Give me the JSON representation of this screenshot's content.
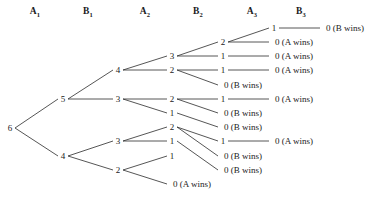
{
  "headers": [
    {
      "label": "A",
      "sub": "1",
      "x": 35
    },
    {
      "label": "B",
      "sub": "1",
      "x": 88
    },
    {
      "label": "A",
      "sub": "2",
      "x": 145
    },
    {
      "label": "B",
      "sub": "2",
      "x": 198
    },
    {
      "label": "A",
      "sub": "3",
      "x": 252
    },
    {
      "label": "B",
      "sub": "3",
      "x": 301
    }
  ],
  "labels": {
    "a_wins": "(A wins)",
    "b_wins": "(B wins)"
  },
  "chart_data": {
    "type": "tree",
    "root_value": "6",
    "leaf_count": 10,
    "columns": [
      "A1",
      "B1",
      "A2",
      "B2",
      "A3",
      "B3"
    ],
    "nodes": [
      {
        "id": "root",
        "value": "6",
        "col": 0,
        "x": 10,
        "y": 128
      },
      {
        "id": "n5",
        "value": "5",
        "col": 1,
        "x": 63,
        "y": 99
      },
      {
        "id": "n4b",
        "value": "4",
        "col": 1,
        "x": 63,
        "y": 156
      },
      {
        "id": "n5_4",
        "value": "4",
        "col": 2,
        "x": 118,
        "y": 70
      },
      {
        "id": "n5_3",
        "value": "3",
        "col": 2,
        "x": 118,
        "y": 99
      },
      {
        "id": "n4_3",
        "value": "3",
        "col": 2,
        "x": 118,
        "y": 141
      },
      {
        "id": "n4_2",
        "value": "2",
        "col": 2,
        "x": 118,
        "y": 170
      },
      {
        "id": "a_3",
        "value": "3",
        "col": 3,
        "x": 172,
        "y": 56
      },
      {
        "id": "a_2",
        "value": "2",
        "col": 3,
        "x": 172,
        "y": 70
      },
      {
        "id": "b_2",
        "value": "2",
        "col": 3,
        "x": 172,
        "y": 99
      },
      {
        "id": "b_1",
        "value": "1",
        "col": 3,
        "x": 172,
        "y": 113
      },
      {
        "id": "c_2",
        "value": "2",
        "col": 3,
        "x": 172,
        "y": 127
      },
      {
        "id": "c_1",
        "value": "1",
        "col": 3,
        "x": 172,
        "y": 141
      },
      {
        "id": "d_1",
        "value": "1",
        "col": 3,
        "x": 172,
        "y": 156
      },
      {
        "id": "d_0",
        "value": "0",
        "col": 3,
        "x": 172,
        "y": 184,
        "win": "A"
      },
      {
        "id": "r1_2",
        "value": "2",
        "col": 4,
        "x": 223,
        "y": 42
      },
      {
        "id": "r2_1",
        "value": "1",
        "col": 4,
        "x": 223,
        "y": 56
      },
      {
        "id": "r3_1",
        "value": "1",
        "col": 4,
        "x": 223,
        "y": 70
      },
      {
        "id": "r4_0",
        "value": "0",
        "col": 4,
        "x": 223,
        "y": 85,
        "win": "B"
      },
      {
        "id": "r5_1",
        "value": "1",
        "col": 4,
        "x": 223,
        "y": 99
      },
      {
        "id": "r6_0",
        "value": "0",
        "col": 4,
        "x": 223,
        "y": 113,
        "win": "B"
      },
      {
        "id": "r7_0",
        "value": "0",
        "col": 4,
        "x": 223,
        "y": 127,
        "win": "B"
      },
      {
        "id": "r8_1",
        "value": "1",
        "col": 4,
        "x": 223,
        "y": 141,
        "win": "none"
      },
      {
        "id": "r9_0",
        "value": "0",
        "col": 4,
        "x": 223,
        "y": 156,
        "win": "B"
      },
      {
        "id": "r10_0",
        "value": "0",
        "col": 4,
        "x": 223,
        "y": 170,
        "win": "B"
      },
      {
        "id": "t1_1",
        "value": "1",
        "col": 5,
        "x": 274,
        "y": 28
      },
      {
        "id": "t2_0",
        "value": "0",
        "col": 5,
        "x": 274,
        "y": 42,
        "win": "A"
      },
      {
        "id": "t3_0",
        "value": "0",
        "col": 5,
        "x": 274,
        "y": 56,
        "win": "A"
      },
      {
        "id": "t4_0",
        "value": "0",
        "col": 5,
        "x": 274,
        "y": 70,
        "win": "A"
      },
      {
        "id": "t5_0",
        "value": "0",
        "col": 5,
        "x": 274,
        "y": 99,
        "win": "A"
      },
      {
        "id": "t6_0",
        "value": "0",
        "col": 5,
        "x": 274,
        "y": 141,
        "win": "A"
      },
      {
        "id": "t7_0",
        "value": "0",
        "col": 6,
        "x": 325,
        "y": 28,
        "win": "B"
      }
    ],
    "edges": [
      [
        "root",
        "n5"
      ],
      [
        "root",
        "n4b"
      ],
      [
        "n5",
        "n5_4"
      ],
      [
        "n5",
        "n5_3"
      ],
      [
        "n4b",
        "n4_3"
      ],
      [
        "n4b",
        "n4_2"
      ],
      [
        "n5_4",
        "a_3"
      ],
      [
        "n5_4",
        "a_2"
      ],
      [
        "n5_3",
        "b_2"
      ],
      [
        "n5_3",
        "b_1"
      ],
      [
        "n4_3",
        "c_2"
      ],
      [
        "n4_3",
        "c_1"
      ],
      [
        "n4_2",
        "d_1"
      ],
      [
        "n4_2",
        "d_0"
      ],
      [
        "a_3",
        "r1_2"
      ],
      [
        "a_3",
        "r2_1"
      ],
      [
        "a_2",
        "r3_1"
      ],
      [
        "a_2",
        "r4_0"
      ],
      [
        "b_2",
        "r5_1"
      ],
      [
        "b_2",
        "r6_0"
      ],
      [
        "b_1",
        "r7_0"
      ],
      [
        "c_2",
        "r8_1"
      ],
      [
        "c_2",
        "r9_0"
      ],
      [
        "c_1",
        "r10_0"
      ],
      [
        "r1_2",
        "t1_1"
      ],
      [
        "r1_2",
        "t2_0"
      ],
      [
        "r2_1",
        "t3_0"
      ],
      [
        "r3_1",
        "t4_0"
      ],
      [
        "r5_1",
        "t5_0"
      ],
      [
        "r8_1",
        "t6_0"
      ],
      [
        "t1_1",
        "t7_0"
      ]
    ]
  }
}
